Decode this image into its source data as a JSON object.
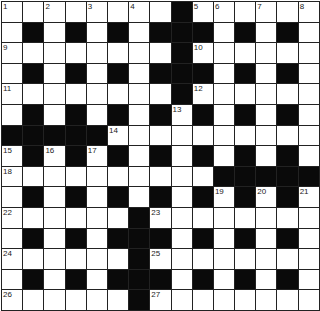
{
  "puzzle": {
    "rows": 15,
    "cols": 15,
    "grid": [
      "........#......",
      ".#.#.#.###.#.#.",
      "........#......",
      ".#.#.#.###.#.#.",
      "........#......",
      ".#.#.#.#.#.#.#.",
      "#####..........",
      ".#.#.#.#.#.#.#.",
      "..........#####",
      ".#.#.#.#.#.#.#.",
      "......#........",
      ".#.#.###.#.#.#.",
      "......#........",
      ".#.#.###.#.#.#.",
      "......#........"
    ],
    "numbers": [
      {
        "r": 0,
        "c": 0,
        "n": "1"
      },
      {
        "r": 0,
        "c": 2,
        "n": "2"
      },
      {
        "r": 0,
        "c": 4,
        "n": "3"
      },
      {
        "r": 0,
        "c": 6,
        "n": "4"
      },
      {
        "r": 0,
        "c": 9,
        "n": "5"
      },
      {
        "r": 0,
        "c": 10,
        "n": "6"
      },
      {
        "r": 0,
        "c": 12,
        "n": "7"
      },
      {
        "r": 0,
        "c": 14,
        "n": "8"
      },
      {
        "r": 2,
        "c": 0,
        "n": "9"
      },
      {
        "r": 2,
        "c": 9,
        "n": "10"
      },
      {
        "r": 4,
        "c": 0,
        "n": "11"
      },
      {
        "r": 4,
        "c": 9,
        "n": "12"
      },
      {
        "r": 5,
        "c": 8,
        "n": "13"
      },
      {
        "r": 6,
        "c": 5,
        "n": "14"
      },
      {
        "r": 7,
        "c": 0,
        "n": "15"
      },
      {
        "r": 7,
        "c": 2,
        "n": "16"
      },
      {
        "r": 7,
        "c": 4,
        "n": "17"
      },
      {
        "r": 8,
        "c": 0,
        "n": "18"
      },
      {
        "r": 9,
        "c": 10,
        "n": "19"
      },
      {
        "r": 9,
        "c": 12,
        "n": "20"
      },
      {
        "r": 9,
        "c": 14,
        "n": "21"
      },
      {
        "r": 10,
        "c": 0,
        "n": "22"
      },
      {
        "r": 10,
        "c": 7,
        "n": "23"
      },
      {
        "r": 12,
        "c": 0,
        "n": "24"
      },
      {
        "r": 12,
        "c": 7,
        "n": "25"
      },
      {
        "r": 14,
        "c": 0,
        "n": "26"
      },
      {
        "r": 14,
        "c": 7,
        "n": "27"
      }
    ],
    "colors": {
      "block": "#0a0a0a",
      "cell": "#ffffff",
      "line": "#222222"
    }
  }
}
